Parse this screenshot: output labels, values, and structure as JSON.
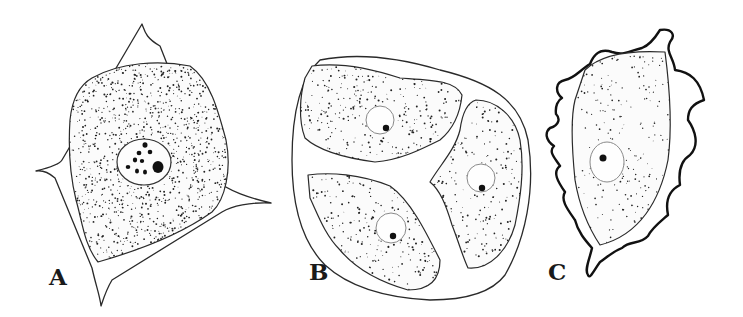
{
  "figure": {
    "colors": {
      "ink": "#1a1a1a",
      "background": "#ffffff"
    },
    "panels": [
      {
        "id": "A",
        "label": "A",
        "content": "single polygonal cell with cell wall, large nucleus with several chromatin granules and one nucleolus"
      },
      {
        "id": "B",
        "label": "B",
        "content": "oval envelope containing three cells, each with a nucleus and nucleolus"
      },
      {
        "id": "C",
        "label": "C",
        "content": "elongated cell with wavy irregular outer membrane and a nucleus"
      }
    ]
  }
}
